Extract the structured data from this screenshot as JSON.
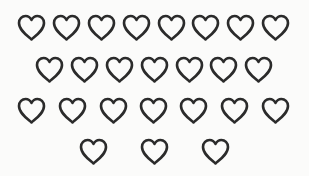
{
  "puzzle": {
    "description": "Rows of outlined heart shapes",
    "icon": "heart-outline-icon",
    "stroke_color": "#2b2b2b",
    "background_color": "#fbfbfa",
    "total_count": 25,
    "rows": [
      {
        "count": 8,
        "y": 14,
        "x": [
          17,
          52,
          87,
          122,
          157,
          191,
          226,
          261
        ]
      },
      {
        "count": 7,
        "y": 56,
        "x": [
          35,
          70,
          105,
          140,
          175,
          209,
          244
        ]
      },
      {
        "count": 7,
        "y": 97,
        "x": [
          17,
          58,
          99,
          139,
          179,
          220,
          261
        ]
      },
      {
        "count": 3,
        "y": 138,
        "x": [
          79,
          140,
          201
        ]
      }
    ]
  }
}
